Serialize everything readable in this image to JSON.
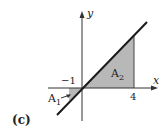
{
  "figure": {
    "panel_label": "(c)",
    "x_axis_label": "x",
    "y_axis_label": "y",
    "ticks": {
      "neg_one": "−1",
      "four": "4"
    },
    "regions": [
      {
        "name": "A",
        "sub": "1",
        "description": "shaded triangle between x=-1 and x=0 below x-axis"
      },
      {
        "name": "A",
        "sub": "2",
        "description": "shaded triangle between x=0 and x=4 under line y=x"
      }
    ],
    "line": "y = x",
    "colors": {
      "shade": "#b8b8b8",
      "line": "#1a1a1a"
    }
  }
}
